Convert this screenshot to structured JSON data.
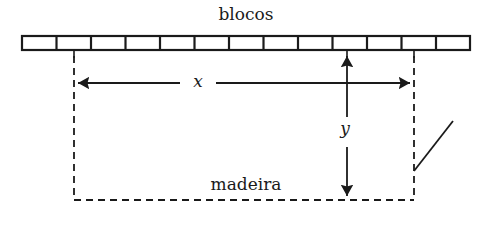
{
  "figure": {
    "title_top": "blocos",
    "title_bottom": "madeira",
    "dimension_labels": {
      "horizontal": "x",
      "vertical": "y"
    },
    "colors": {
      "stroke": "#1a1a1a",
      "background": "#ffffff",
      "text": "#1a1a1a"
    },
    "geometry": {
      "bar": {
        "x": 22,
        "y": 36,
        "width": 448,
        "height": 14,
        "cell_count": 13,
        "stroke_width": 2
      },
      "ticks_y_end": 57,
      "tick_positions": [
        74,
        347,
        414
      ],
      "dashed_outline": {
        "left_x": 74,
        "right_x": 414,
        "top_y": 50,
        "bottom_y": 200,
        "dash_pattern": "7,5"
      },
      "x_arrow": {
        "y": 83,
        "left_x": 74,
        "right_x": 414,
        "gap_left": 183,
        "gap_right": 213
      },
      "y_arrow": {
        "x": 347,
        "top_y": 52,
        "bottom_y": 200,
        "gap_top": 118,
        "gap_bottom": 145
      },
      "diagonal_line": {
        "x1": 414,
        "y1": 171,
        "x2": 453,
        "y2": 121
      }
    }
  }
}
